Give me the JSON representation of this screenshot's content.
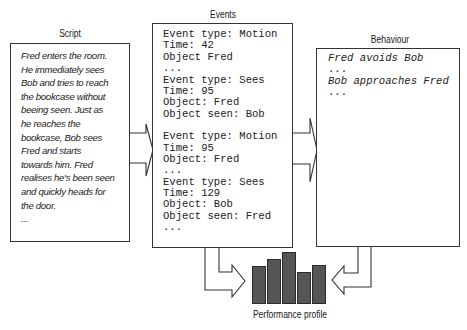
{
  "titles": {
    "script": "Script",
    "events": "Events",
    "behaviour": "Behaviour",
    "performance": "Performance profile"
  },
  "script": {
    "text": "Fred enters the room.\nHe immediately sees\nBob and tries to reach\nthe bookcase without\nbeeing seen.  Just as\nhe reaches the\nbookcase, Bob sees\nFred and starts\ntowards him. Fred\nrealises he's been seen\nand quickly heads for\nthe door.\n..."
  },
  "events": {
    "lines": [
      "Event type: Motion",
      "Time: 42",
      "Object Fred",
      "...",
      "Event type: Sees",
      "Time: 95",
      "Object: Fred",
      "Object seen: Bob",
      "",
      "Event type: Motion",
      "Time: 95",
      "Object: Fred",
      "...",
      "Event type: Sees",
      "Time: 129",
      "Object: Bob",
      "Object seen: Fred",
      "..."
    ]
  },
  "behaviour": {
    "lines": [
      "Fred avoids Bob",
      "...",
      "Bob approaches Fred",
      "..."
    ]
  },
  "performance_profile": {
    "bar_heights": [
      38,
      45,
      52,
      32,
      39
    ],
    "bar_color": "#555555"
  }
}
